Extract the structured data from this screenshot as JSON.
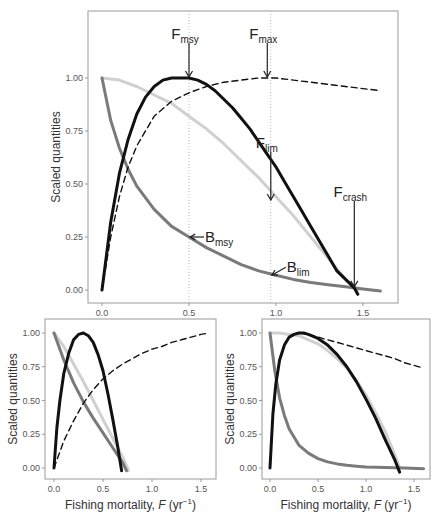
{
  "chart_data": [
    {
      "id": "main",
      "type": "line",
      "title": "",
      "xlabel": "",
      "ylabel": "Scaled quantities",
      "xlim": [
        -0.08,
        1.7
      ],
      "ylim": [
        -0.05,
        1.32
      ],
      "xticks": [
        0.0,
        0.5,
        1.0,
        1.5
      ],
      "xtick_labels": [
        "0.0",
        "0.5",
        "1.0",
        "1.5"
      ],
      "yticks": [
        0.0,
        0.25,
        0.5,
        0.75,
        1.0
      ],
      "ytick_labels": [
        "0.00",
        "0.25",
        "0.50",
        "0.75",
        "1.00"
      ],
      "grid": false,
      "vlines": [
        0.5,
        0.97
      ],
      "series": [
        {
          "name": "Yield",
          "style": "solid-black",
          "x": [
            0,
            0.05,
            0.1,
            0.15,
            0.2,
            0.25,
            0.3,
            0.35,
            0.4,
            0.45,
            0.5,
            0.55,
            0.6,
            0.65,
            0.7,
            0.75,
            0.8,
            0.85,
            0.9,
            0.95,
            1.0,
            1.05,
            1.1,
            1.15,
            1.2,
            1.25,
            1.3,
            1.35,
            1.4,
            1.45,
            1.47
          ],
          "y": [
            0,
            0.32,
            0.55,
            0.71,
            0.83,
            0.91,
            0.96,
            0.99,
            1.0,
            1.0,
            1.0,
            0.99,
            0.97,
            0.94,
            0.9,
            0.86,
            0.81,
            0.76,
            0.7,
            0.64,
            0.58,
            0.51,
            0.44,
            0.37,
            0.3,
            0.23,
            0.16,
            0.09,
            0.05,
            0.01,
            -0.02
          ]
        },
        {
          "name": "Yield per recruit",
          "style": "dashed-black",
          "x": [
            0,
            0.05,
            0.1,
            0.15,
            0.2,
            0.3,
            0.4,
            0.5,
            0.6,
            0.7,
            0.8,
            0.9,
            0.95,
            1.0,
            1.1,
            1.2,
            1.3,
            1.4,
            1.5,
            1.6
          ],
          "y": [
            0,
            0.25,
            0.44,
            0.58,
            0.68,
            0.82,
            0.89,
            0.93,
            0.96,
            0.98,
            0.99,
            1.0,
            1.0,
            1.0,
            0.99,
            0.98,
            0.97,
            0.96,
            0.95,
            0.94
          ]
        },
        {
          "name": "Recruitment",
          "style": "light-grey",
          "x": [
            0,
            0.1,
            0.2,
            0.3,
            0.4,
            0.5,
            0.6,
            0.7,
            0.8,
            0.9,
            1.0,
            1.1,
            1.2,
            1.3,
            1.4,
            1.47
          ],
          "y": [
            1.0,
            0.99,
            0.96,
            0.92,
            0.88,
            0.82,
            0.76,
            0.69,
            0.61,
            0.53,
            0.44,
            0.35,
            0.25,
            0.15,
            0.05,
            0.0
          ]
        },
        {
          "name": "Biomass",
          "style": "mid-grey",
          "x": [
            0,
            0.05,
            0.1,
            0.15,
            0.2,
            0.3,
            0.4,
            0.5,
            0.6,
            0.7,
            0.8,
            0.9,
            1.0,
            1.1,
            1.2,
            1.3,
            1.4,
            1.5,
            1.6
          ],
          "y": [
            1.0,
            0.8,
            0.67,
            0.57,
            0.49,
            0.38,
            0.3,
            0.25,
            0.2,
            0.16,
            0.12,
            0.09,
            0.07,
            0.05,
            0.035,
            0.025,
            0.015,
            0.005,
            -0.005
          ]
        }
      ],
      "annotations": [
        {
          "main": "F",
          "sub": "msy",
          "x": 0.5,
          "y": 1.0,
          "direction": "down"
        },
        {
          "main": "F",
          "sub": "max",
          "x": 0.95,
          "y": 1.0,
          "direction": "down"
        },
        {
          "main": "F",
          "sub": "lim",
          "x": 0.97,
          "y": 0.42,
          "direction": "down"
        },
        {
          "main": "F",
          "sub": "crash",
          "x": 1.45,
          "y": 0.01,
          "direction": "down"
        },
        {
          "main": "B",
          "sub": "msy",
          "x": 0.5,
          "y": 0.25,
          "direction": "left"
        },
        {
          "main": "B",
          "sub": "lim",
          "x": 0.97,
          "y": 0.07,
          "direction": "left"
        }
      ]
    },
    {
      "id": "bottom-left",
      "type": "line",
      "title": "",
      "xlabel": "Fishing mortality, F (yr⁻¹)",
      "ylabel": "Scaled quantities",
      "xlim": [
        -0.06,
        1.66
      ],
      "ylim": [
        -0.08,
        1.08
      ],
      "xticks": [
        0.0,
        0.5,
        1.0,
        1.5
      ],
      "xtick_labels": [
        "0.0",
        "0.5",
        "1.0",
        "1.5"
      ],
      "yticks": [
        0.0,
        0.25,
        0.5,
        0.75,
        1.0
      ],
      "ytick_labels": [
        "0.00",
        "0.25",
        "0.50",
        "0.75",
        "1.00"
      ],
      "grid": false,
      "series": [
        {
          "name": "Yield",
          "style": "solid-black",
          "x": [
            0,
            0.03,
            0.06,
            0.1,
            0.15,
            0.2,
            0.25,
            0.3,
            0.35,
            0.4,
            0.45,
            0.5,
            0.55,
            0.6,
            0.65,
            0.69
          ],
          "y": [
            0,
            0.3,
            0.5,
            0.7,
            0.85,
            0.95,
            0.99,
            1.0,
            0.98,
            0.93,
            0.84,
            0.72,
            0.55,
            0.36,
            0.16,
            -0.02
          ]
        },
        {
          "name": "Yield per recruit",
          "style": "dashed-black",
          "x": [
            0,
            0.1,
            0.2,
            0.3,
            0.4,
            0.5,
            0.6,
            0.7,
            0.8,
            0.9,
            1.0,
            1.1,
            1.2,
            1.3,
            1.4,
            1.5,
            1.58
          ],
          "y": [
            0,
            0.2,
            0.35,
            0.48,
            0.58,
            0.66,
            0.72,
            0.77,
            0.81,
            0.85,
            0.88,
            0.9,
            0.93,
            0.95,
            0.97,
            0.99,
            1.0
          ]
        },
        {
          "name": "Recruitment",
          "style": "light-grey",
          "x": [
            0,
            0.1,
            0.2,
            0.3,
            0.4,
            0.5,
            0.6,
            0.7,
            0.76
          ],
          "y": [
            1.0,
            0.9,
            0.77,
            0.64,
            0.5,
            0.36,
            0.22,
            0.08,
            -0.02
          ]
        },
        {
          "name": "Biomass",
          "style": "mid-grey",
          "x": [
            0,
            0.1,
            0.2,
            0.3,
            0.4,
            0.5,
            0.6,
            0.7,
            0.74
          ],
          "y": [
            1.0,
            0.8,
            0.63,
            0.49,
            0.37,
            0.26,
            0.15,
            0.04,
            -0.02
          ]
        }
      ]
    },
    {
      "id": "bottom-right",
      "type": "line",
      "title": "",
      "xlabel": "Fishing mortality, F (yr⁻¹)",
      "ylabel": "Scaled quantities",
      "xlim": [
        -0.06,
        1.66
      ],
      "ylim": [
        -0.08,
        1.08
      ],
      "xticks": [
        0.0,
        0.5,
        1.0,
        1.5
      ],
      "xtick_labels": [
        "0.0",
        "0.5",
        "1.0",
        "1.5"
      ],
      "yticks": [
        0.0,
        0.25,
        0.5,
        0.75,
        1.0
      ],
      "ytick_labels": [
        "0.00",
        "0.25",
        "0.50",
        "0.75",
        "1.00"
      ],
      "grid": false,
      "series": [
        {
          "name": "Yield",
          "style": "solid-black",
          "x": [
            0,
            0.03,
            0.06,
            0.1,
            0.15,
            0.2,
            0.25,
            0.3,
            0.35,
            0.4,
            0.5,
            0.6,
            0.7,
            0.8,
            0.9,
            1.0,
            1.1,
            1.2,
            1.3,
            1.35
          ],
          "y": [
            0,
            0.4,
            0.62,
            0.8,
            0.91,
            0.97,
            0.99,
            1.0,
            1.0,
            0.99,
            0.96,
            0.91,
            0.84,
            0.75,
            0.64,
            0.51,
            0.37,
            0.21,
            0.06,
            -0.03
          ]
        },
        {
          "name": "Yield per recruit",
          "style": "dashed-black",
          "x": [
            0.3,
            0.4,
            0.5,
            0.6,
            0.7,
            0.8,
            0.9,
            1.0,
            1.1,
            1.2,
            1.3,
            1.4,
            1.5,
            1.6
          ],
          "y": [
            1.0,
            0.99,
            0.97,
            0.95,
            0.93,
            0.91,
            0.89,
            0.87,
            0.85,
            0.83,
            0.81,
            0.78,
            0.76,
            0.74
          ]
        },
        {
          "name": "Recruitment",
          "style": "light-grey",
          "x": [
            0,
            0.1,
            0.2,
            0.3,
            0.4,
            0.5,
            0.6,
            0.7,
            0.8,
            0.9,
            1.0,
            1.1,
            1.2,
            1.3,
            1.35
          ],
          "y": [
            1.0,
            1.0,
            0.99,
            0.98,
            0.95,
            0.92,
            0.87,
            0.81,
            0.74,
            0.65,
            0.54,
            0.41,
            0.27,
            0.1,
            0.0
          ]
        },
        {
          "name": "Biomass",
          "style": "mid-grey",
          "x": [
            0,
            0.05,
            0.1,
            0.15,
            0.2,
            0.3,
            0.4,
            0.5,
            0.6,
            0.7,
            0.8,
            0.9,
            1.0,
            1.2,
            1.4,
            1.6
          ],
          "y": [
            1.0,
            0.72,
            0.52,
            0.39,
            0.29,
            0.17,
            0.11,
            0.07,
            0.045,
            0.03,
            0.02,
            0.013,
            0.008,
            0.003,
            0.0,
            -0.005
          ]
        }
      ]
    }
  ],
  "labels": {
    "ylabel": "Scaled quantities",
    "xlabel_main": "Fishing mortality, ",
    "xlabel_var": "F",
    "xlabel_unit": " (yr",
    "xlabel_exp": "−1",
    "xlabel_close": ")"
  },
  "colors": {
    "yield": "#111111",
    "ypr": "#111111",
    "recruitment": "#d0d0d0",
    "biomass": "#7a7a7a",
    "frame": "#9a9a9a",
    "vline": "#aaaaaa"
  }
}
